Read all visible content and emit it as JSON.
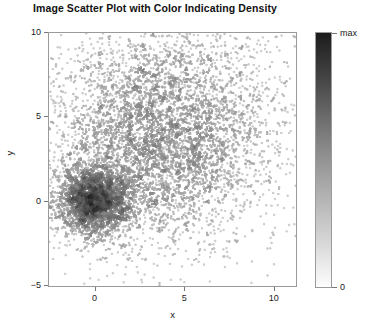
{
  "chart_data": {
    "type": "scatter",
    "title": "Image Scatter Plot with Color Indicating Density",
    "xlabel": "x",
    "ylabel": "y",
    "xlim": [
      -2.6,
      11.3
    ],
    "ylim": [
      -5.1,
      10.0
    ],
    "xticks": [
      0,
      5,
      10
    ],
    "xtick_labels": [
      "0",
      "5",
      "10"
    ],
    "yticks": [
      -5,
      0,
      5,
      10
    ],
    "ytick_labels": [
      "−5",
      "0",
      "5",
      "10"
    ],
    "grid": false,
    "colormap": "gray_reversed",
    "colorbar": {
      "position": "right",
      "min_label": "0",
      "max_label": "max",
      "min_color": "#ffffff",
      "max_color": "#1c1c1c",
      "meaning": "point density"
    },
    "series": [
      {
        "name": "dense-core-cluster",
        "center": [
          0.0,
          0.0
        ],
        "spread": 1.05,
        "n_points": 2600,
        "peak_density": "max",
        "description": "tight compact cluster with near-black high-density core"
      },
      {
        "name": "diffuse-broad-cluster",
        "center": [
          3.7,
          4.0
        ],
        "spread": 3.3,
        "n_points": 5200,
        "peak_density": "low",
        "description": "large sparse light-gray cloud of scattered points"
      }
    ],
    "annotations": []
  },
  "figure": {
    "background_color": "#ffffff",
    "frame_color": "#9a9a9a",
    "text_color": "#1a1a1a"
  }
}
